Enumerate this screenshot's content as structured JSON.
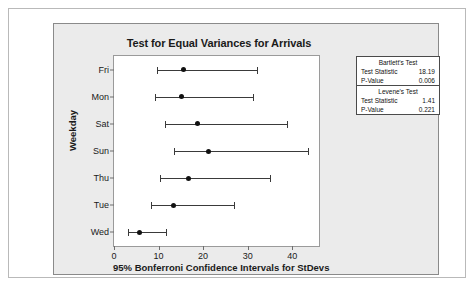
{
  "chart_data": {
    "type": "interval",
    "title": "Test for Equal Variances for Arrivals",
    "xlabel": "95% Bonferroni Confidence Intervals for StDevs",
    "ylabel": "Weekday",
    "categories": [
      "Fri",
      "Mon",
      "Sat",
      "Sun",
      "Thu",
      "Tue",
      "Wed"
    ],
    "xlim": [
      0,
      46
    ],
    "xticks": [
      0,
      10,
      20,
      30,
      40
    ],
    "grid": false,
    "legend": null,
    "series": [
      {
        "name": "95% Bonferroni CI for StDev",
        "points": [
          {
            "category": "Fri",
            "lower": 9.7,
            "estimate": 15.6,
            "upper": 32.1
          },
          {
            "category": "Mon",
            "lower": 9.3,
            "estimate": 15.2,
            "upper": 31.1
          },
          {
            "category": "Sat",
            "lower": 11.4,
            "estimate": 18.8,
            "upper": 38.9
          },
          {
            "category": "Sun",
            "lower": 13.5,
            "estimate": 21.3,
            "upper": 43.5
          },
          {
            "category": "Thu",
            "lower": 10.4,
            "estimate": 16.8,
            "upper": 34.9
          },
          {
            "category": "Tue",
            "lower": 8.3,
            "estimate": 13.4,
            "upper": 26.9
          },
          {
            "category": "Wed",
            "lower": 3.2,
            "estimate": 5.7,
            "upper": 11.6
          }
        ]
      }
    ],
    "annotations": {
      "bartlett": {
        "header": "Bartlett's Test",
        "test_statistic_label": "Test Statistic",
        "test_statistic_value": "18.19",
        "p_value_label": "P-Value",
        "p_value_value": "0.006"
      },
      "levene": {
        "header": "Levene's Test",
        "test_statistic_label": "Test Statistic",
        "test_statistic_value": "1.41",
        "p_value_label": "P-Value",
        "p_value_value": "0.221"
      }
    }
  },
  "colors": {
    "panel_background": "#ebebeb",
    "plot_background": "#ffffff",
    "line": "#3a3a3a",
    "point": "#111111",
    "axis": "#6e6e6e",
    "text": "#1a1a1a"
  }
}
